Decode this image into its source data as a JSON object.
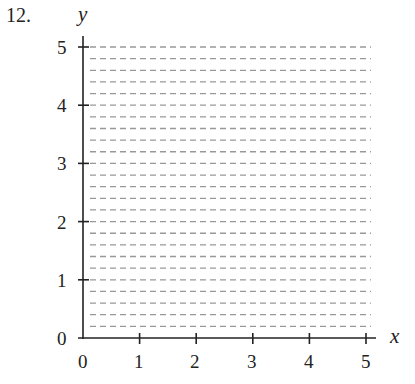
{
  "problem_number": "12.",
  "chart_data": {
    "type": "line",
    "title": "",
    "xlabel": "x",
    "ylabel": "y",
    "xlim": [
      0,
      5
    ],
    "ylim": [
      0,
      5
    ],
    "x_ticks": [
      "0",
      "1",
      "2",
      "3",
      "4",
      "5"
    ],
    "y_ticks": [
      "0",
      "1",
      "2",
      "3",
      "4",
      "5"
    ],
    "grid": {
      "horizontal_dashed": true,
      "step": 0.2,
      "vertical": false
    },
    "series": [],
    "colors": {
      "axis": "#222222",
      "grid": "#999999"
    }
  }
}
